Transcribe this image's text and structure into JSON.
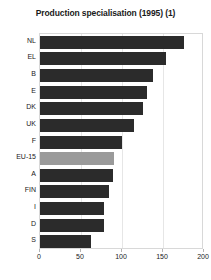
{
  "chart_data": {
    "type": "bar",
    "orientation": "horizontal",
    "title": "Production specialisation (1995) (1)",
    "xlabel": "",
    "ylabel": "",
    "categories": [
      "NL",
      "EL",
      "B",
      "E",
      "DK",
      "UK",
      "F",
      "EU-15",
      "A",
      "FIN",
      "I",
      "D",
      "S"
    ],
    "values": [
      176,
      154,
      138,
      131,
      126,
      115,
      100,
      90,
      89,
      84,
      78,
      78,
      62
    ],
    "highlight_category": "EU-15",
    "xlim": [
      0,
      200
    ],
    "xticks": [
      0,
      50,
      100,
      150,
      200
    ],
    "xtick_labels": [
      "0",
      "50",
      "100",
      "150",
      "200"
    ],
    "grid": true,
    "grid_axis": "x",
    "legend": false,
    "colors": {
      "bar": "#2b2b2b",
      "bar_highlight": "#9a9a9a",
      "grid": "#e6e6e6",
      "border": "#d8d8d8",
      "text": "#1a1a1a",
      "background": "#ffffff"
    }
  }
}
